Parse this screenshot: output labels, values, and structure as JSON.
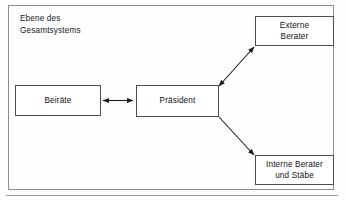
{
  "diagram": {
    "level_caption": "Ebene des\nGesamtsystems",
    "frame_border_color": "#8d8d8d",
    "node_border_color": "#4d4d4d",
    "connector_color": "#1b1b1b",
    "background_color": "#fefefe",
    "nodes": [
      {
        "id": "beiraete",
        "label": "Beiräte"
      },
      {
        "id": "praesident",
        "label": "Präsident"
      },
      {
        "id": "externe",
        "label": "Externe\nBerater"
      },
      {
        "id": "interne",
        "label": "Interne Berater\nund Stäbe"
      }
    ],
    "connectors": [
      {
        "from": "beiraete",
        "to": "praesident",
        "arrowheads": "both"
      },
      {
        "from": "praesident",
        "to": "externe",
        "arrowheads": "both"
      },
      {
        "from": "praesident",
        "to": "interne",
        "arrowheads": "to"
      }
    ]
  }
}
